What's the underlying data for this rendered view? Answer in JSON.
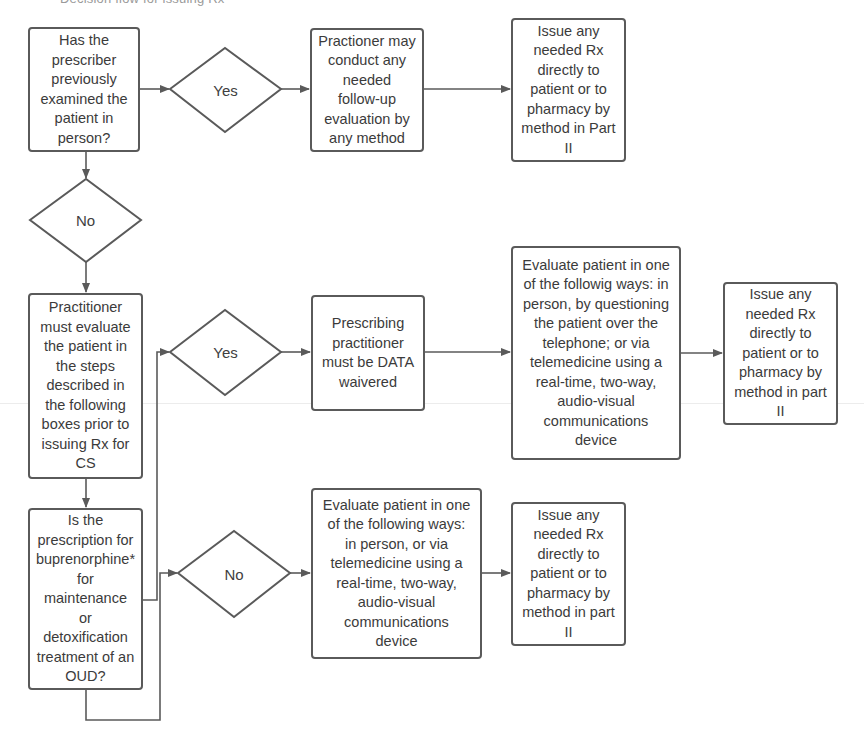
{
  "header": {
    "top_fragment": "Decision flow for issuing Rx"
  },
  "flowchart": {
    "q_prior_exam": "Has the\nprescriber\npreviously\nexamined the\npatient in\nperson?",
    "d_top_yes": "Yes",
    "followup": "Practioner may\nconduct any\nneeded\nfollow-up\nevaluation by\nany method",
    "issue_top": "Issue any\nneeded Rx\ndirectly to\npatient or to\npharmacy by\nmethod in Part\nII",
    "d_no": "No",
    "must_evaluate": "Practitioner\nmust evaluate\nthe patient in\nthe steps\ndescribed in\nthe following\nboxes prior to\nissuing Rx for\nCS",
    "q_buprenorphine": "Is the\nprescription for\nbuprenorphine*\nfor\nmaintenance\nor\ndetoxification\ntreatment of an\nOUD?",
    "d_mid_yes": "Yes",
    "data_waivered": "Prescribing\npractitioner\nmust be DATA\nwaivered",
    "evaluate_phone": "Evaluate patient in one\nof the followig ways: in\nperson, by questioning\nthe patient over the\ntelephone; or via\ntelemedicine using a\nreal-time, two-way,\naudio-visual\ncommunications\ndevice",
    "issue_mid": "Issue any\nneeded Rx\ndirectly to\npatient or to\npharmacy by\nmethod in part\nII",
    "d_bottom_no": "No",
    "evaluate_video": "Evaluate patient in one\nof the following ways:\nin person, or via\ntelemedicine using a\nreal-time, two-way,\naudio-visual\ncommunications\ndevice",
    "issue_bottom": "Issue any\nneeded Rx\ndirectly to\npatient or to\npharmacy by\nmethod in part\nII"
  },
  "colors": {
    "stroke": "#5a5a5a",
    "text": "#3b3b3b",
    "background": "#ffffff"
  }
}
